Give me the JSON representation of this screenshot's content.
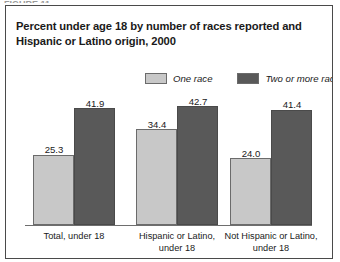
{
  "top_sliver": "FIGURE 11.",
  "figure": {
    "title_line1": "Percent under age 18 by number of races reported and",
    "title_line2": "Hispanic or Latino origin, 2000"
  },
  "colors": {
    "one_race": "#c8c8c8",
    "two_or_more_races": "#595959",
    "frame": "#4a4a4a",
    "axis": "#6e6e6e",
    "text": "#1a1a1a"
  },
  "chart_data": {
    "type": "bar",
    "title": "Percent under age 18 by number of races reported and Hispanic or Latino origin, 2000",
    "xlabel": "",
    "ylabel": "",
    "ylim": [
      0,
      45
    ],
    "grid": false,
    "legend_position": "top-right",
    "categories": [
      "Total, under 18",
      "Hispanic or Latino, under 18",
      "Not Hispanic or Latino, under 18"
    ],
    "category_lines": [
      [
        "Total, under 18"
      ],
      [
        "Hispanic or Latino,",
        "under 18"
      ],
      [
        "Not Hispanic or Latino,",
        "under 18"
      ]
    ],
    "series": [
      {
        "name": "One race",
        "color": "#c8c8c8",
        "values": [
          25.3,
          34.4,
          24.0
        ],
        "labels": [
          "25.3",
          "34.4",
          "24.0"
        ]
      },
      {
        "name": "Two or more races",
        "color": "#595959",
        "values": [
          41.9,
          42.7,
          41.4
        ],
        "labels": [
          "41.9",
          "42.7",
          "41.4"
        ]
      }
    ]
  }
}
